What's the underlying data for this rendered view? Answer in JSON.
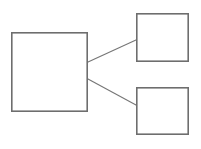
{
  "diagram": {
    "title": "",
    "canvas": {
      "width": 201,
      "height": 149,
      "background": "#ffffff"
    },
    "style": {
      "node_border_color": "#6e6e6e",
      "node_fill_color": "#ffffff",
      "node_border_width": 1.6,
      "edge_color": "#767676",
      "edge_width": 1.1
    },
    "nodes": [
      {
        "id": "node-left",
        "label": "",
        "x": 11,
        "y": 32,
        "width": 77,
        "height": 80
      },
      {
        "id": "node-top-right",
        "label": "",
        "x": 136,
        "y": 13,
        "width": 53,
        "height": 49
      },
      {
        "id": "node-bottom-right",
        "label": "",
        "x": 136,
        "y": 87,
        "width": 53,
        "height": 48
      }
    ],
    "edges": [
      {
        "id": "edge-left-to-top-right",
        "label": "",
        "from": "node-left",
        "to": "node-top-right",
        "x1": 88,
        "y1": 62,
        "x2": 136,
        "y2": 40
      },
      {
        "id": "edge-left-to-bottom-right",
        "label": "",
        "from": "node-left",
        "to": "node-bottom-right",
        "x1": 88,
        "y1": 79,
        "x2": 136,
        "y2": 105
      }
    ]
  }
}
